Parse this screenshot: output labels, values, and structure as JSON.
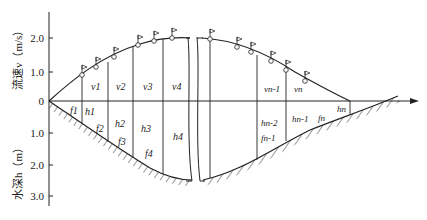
{
  "figure": {
    "type": "diagram",
    "y_axis_top": {
      "label": "流速v（m/s）",
      "ticks": [
        "2.0",
        "1.0",
        "0"
      ]
    },
    "y_axis_bottom": {
      "label": "水深h（m）",
      "ticks": [
        "1.0",
        "2.0",
        "3.0"
      ]
    },
    "velocity_labels": [
      "v1",
      "v2",
      "v3",
      "v4",
      "vn-1",
      "vn"
    ],
    "depth_labels": [
      "h1",
      "h2",
      "h3",
      "h4",
      "hn-2",
      "hn-1",
      "hn"
    ],
    "area_labels": [
      "f1",
      "f2",
      "f3",
      "f4",
      "fn-1",
      "fn"
    ],
    "marker_icon": "flag-icon",
    "colors": {
      "line": "#222222",
      "background": "#ffffff"
    }
  }
}
